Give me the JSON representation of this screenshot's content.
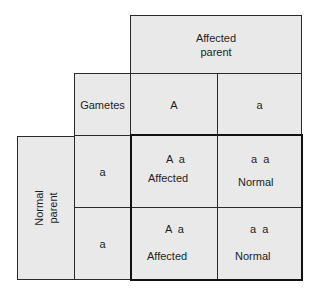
{
  "diagram": {
    "type": "punnett-square",
    "top_parent": {
      "label_line1": "Affected",
      "label_line2": "parent",
      "gametes": [
        "A",
        "a"
      ]
    },
    "side_parent": {
      "label_line1": "Normal",
      "label_line2": "parent",
      "gametes": [
        "a",
        "a"
      ]
    },
    "gametes_label": "Gametes",
    "offspring": [
      [
        {
          "genotype": "A  a",
          "phenotype": "Affected"
        },
        {
          "genotype": "a  a",
          "phenotype": "Normal"
        }
      ],
      [
        {
          "genotype": "A  a",
          "phenotype": "Affected"
        },
        {
          "genotype": "a  a",
          "phenotype": "Normal"
        }
      ]
    ],
    "colors": {
      "fill": "#e9e9e9",
      "border": "#2a2a2a",
      "thick_border": "#111111"
    }
  }
}
